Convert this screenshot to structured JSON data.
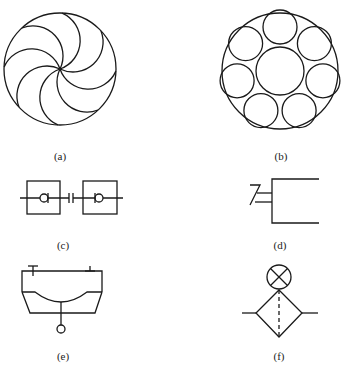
{
  "figure": {
    "panels": [
      {
        "id": "a",
        "label": "(a)",
        "description": "Circle with eight curved spiral vanes meeting at center"
      },
      {
        "id": "b",
        "label": "(b)",
        "description": "Outer circle containing one large central circle surrounded by seven smaller circles"
      },
      {
        "id": "c",
        "label": "(c)",
        "description": "Two square boxes with check-valve diamonds joined by a quick-coupling symbol"
      },
      {
        "id": "d",
        "label": "(d)",
        "description": "Open rectangle with a Z-shaped spring/switch on the left side"
      },
      {
        "id": "e",
        "label": "(e)",
        "description": "Tank/trapezoid with curved inner surface, top line with T markers and a stem ending in a small circle"
      },
      {
        "id": "f",
        "label": "(f)",
        "description": "Diamond filter with dashed vertical line, lines to left and right, and a circle-X indicator on top"
      }
    ]
  },
  "colors": {
    "stroke": "#1a1a1a",
    "background": "#ffffff"
  }
}
